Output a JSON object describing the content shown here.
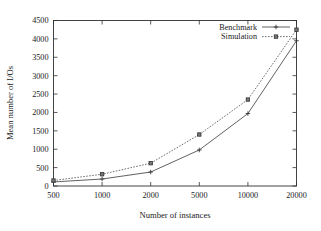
{
  "chart_data": {
    "type": "line",
    "title": "",
    "subtitle": "",
    "xlabel": "Number of instances",
    "ylabel": "Mean number of I/Os",
    "categories": [
      "500",
      "1000",
      "2000",
      "5000",
      "10000",
      "20000"
    ],
    "x": [
      500,
      1000,
      2000,
      5000,
      10000,
      20000
    ],
    "x_scale": "ordinal",
    "xtick_labels": [
      "500",
      "1000",
      "2000",
      "5000",
      "10000",
      "20000"
    ],
    "ytick_labels": [
      "0",
      "500",
      "1000",
      "1500",
      "2000",
      "2500",
      "3000",
      "3500",
      "4000",
      "4500"
    ],
    "ytick_values": [
      0,
      500,
      1000,
      1500,
      2000,
      2500,
      3000,
      3500,
      4000,
      4500
    ],
    "ylim": [
      0,
      4500
    ],
    "grid": false,
    "legend_position": "top-right",
    "series": [
      {
        "name": "Benchmark",
        "style": "solid",
        "marker": "plus",
        "color": "#444444",
        "values": [
          110,
          190,
          380,
          980,
          1970,
          3950
        ]
      },
      {
        "name": "Simulation",
        "style": "dotted",
        "marker": "box",
        "color": "#555555",
        "values": [
          150,
          320,
          620,
          1400,
          2350,
          4250
        ]
      }
    ]
  },
  "legend": {
    "entries": [
      {
        "label": "Benchmark"
      },
      {
        "label": "Simulation"
      }
    ]
  },
  "axes": {
    "x_title": "Number of instances",
    "y_title": "Mean number of I/Os"
  }
}
